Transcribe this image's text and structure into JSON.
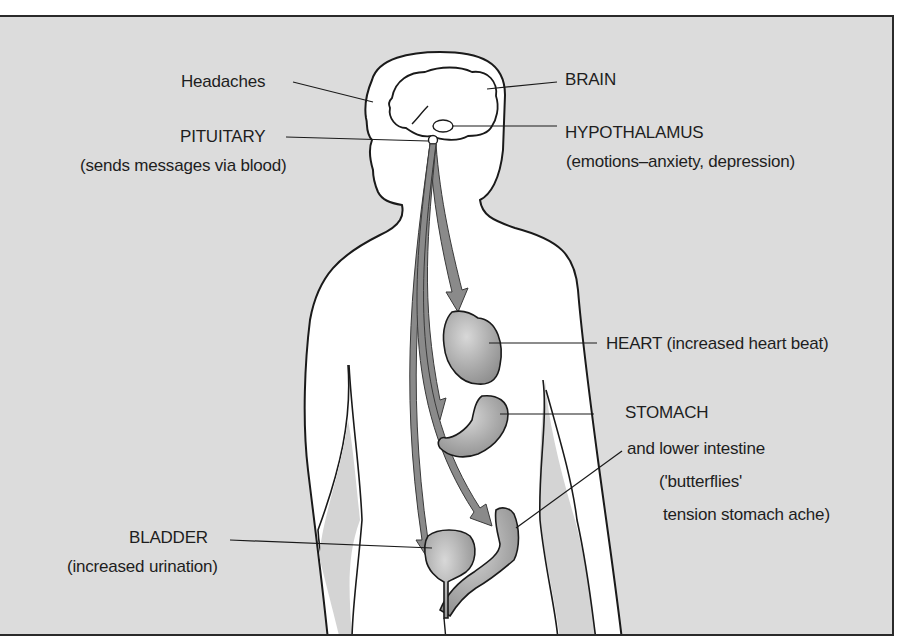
{
  "figure": {
    "type": "anatomical stress-response diagram",
    "background_color": "#dcdcdc",
    "body_color": "#ffffff",
    "arrow_color": "#8a8a8a",
    "organ_color": "#a8a8a8",
    "outline_color": "#1a1a1a"
  },
  "labels": {
    "headaches": "Headaches",
    "pituitary": "PITUITARY",
    "pituitary_note": "(sends messages via blood)",
    "brain": "BRAIN",
    "hypothalamus": "HYPOTHALAMUS",
    "hypothalamus_note": "(emotions–anxiety, depression)",
    "heart": "HEART (increased heart beat)",
    "stomach": "STOMACH",
    "stomach_line2": "and lower intestine",
    "stomach_line3": "('butterflies'",
    "stomach_line4": "tension stomach ache)",
    "bladder": "BLADDER",
    "bladder_note": "(increased urination)"
  }
}
